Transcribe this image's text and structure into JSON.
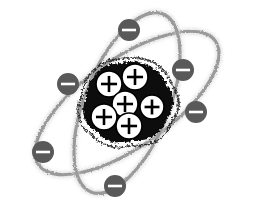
{
  "figure": {
    "title": "Atom model diagram",
    "background_color": "#ffffff",
    "width": 254,
    "height": 210
  },
  "palette": {
    "background": "#ffffff",
    "nucleus_fill": "#0a0a0a",
    "proton_fill": "#ffffff",
    "proton_symbol": "#000000",
    "electron_fill": "#595959",
    "electron_symbol": "#ffffff",
    "orbit_stroke": "#9a9a9a",
    "orbit_halo": "#cfcfcf"
  },
  "nucleus": {
    "label": "nucleus",
    "center_x": 128,
    "center_y": 100,
    "proton_count": 6,
    "proton_symbol": "+",
    "protons": [
      {
        "id": "proton-1",
        "symbol": "+",
        "cx": 109,
        "cy": 84,
        "r": 13
      },
      {
        "id": "proton-2",
        "symbol": "+",
        "cx": 135,
        "cy": 77,
        "r": 13
      },
      {
        "id": "proton-3",
        "symbol": "+",
        "cx": 125,
        "cy": 104,
        "r": 13
      },
      {
        "id": "proton-4",
        "symbol": "+",
        "cx": 152,
        "cy": 107,
        "r": 12
      },
      {
        "id": "proton-5",
        "symbol": "+",
        "cx": 104,
        "cy": 117,
        "r": 13
      },
      {
        "id": "proton-6",
        "symbol": "+",
        "cx": 129,
        "cy": 126,
        "r": 13
      }
    ]
  },
  "orbits": [
    {
      "id": "orbit-1",
      "label": "electron-orbit-major",
      "center_x": 127,
      "center_y": 103,
      "radius_x": 108,
      "radius_y": 44,
      "rotation_deg": -35
    },
    {
      "id": "orbit-2",
      "label": "electron-orbit-minor",
      "center_x": 127,
      "center_y": 103,
      "radius_x": 96,
      "radius_y": 42,
      "rotation_deg": -68
    }
  ],
  "electrons": {
    "count": 6,
    "symbol": "–",
    "items": [
      {
        "id": "electron-1",
        "symbol": "-",
        "cx": 129,
        "cy": 30,
        "r": 11,
        "orbit": "orbit-2"
      },
      {
        "id": "electron-2",
        "symbol": "-",
        "cx": 183,
        "cy": 70,
        "r": 11,
        "orbit": "orbit-1"
      },
      {
        "id": "electron-3",
        "symbol": "-",
        "cx": 196,
        "cy": 112,
        "r": 11,
        "orbit": "orbit-2"
      },
      {
        "id": "electron-4",
        "symbol": "-",
        "cx": 68,
        "cy": 84,
        "r": 11,
        "orbit": "orbit-1"
      },
      {
        "id": "electron-5",
        "symbol": "-",
        "cx": 43,
        "cy": 152,
        "r": 11,
        "orbit": "orbit-2"
      },
      {
        "id": "electron-6",
        "symbol": "-",
        "cx": 115,
        "cy": 186,
        "r": 11,
        "orbit": "orbit-1"
      }
    ]
  }
}
